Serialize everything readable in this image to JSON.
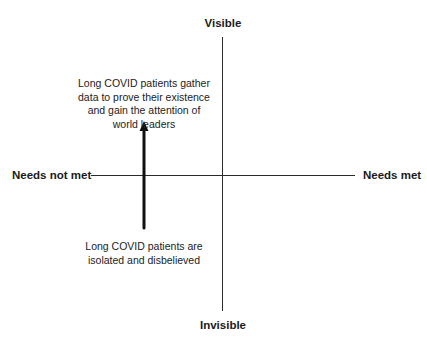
{
  "diagram": {
    "type": "quadrant",
    "axes": {
      "vertical": {
        "top_label": "Visible",
        "bottom_label": "Invisible"
      },
      "horizontal": {
        "left_label": "Needs not met",
        "right_label": "Needs met"
      }
    },
    "annotations": [
      {
        "id": "start",
        "text": "Long COVID patients are isolated and disbelieved",
        "position": "lower-left"
      },
      {
        "id": "end",
        "text": "Long COVID patients gather data to prove their existence and gain the attention of world leaders",
        "position": "upper-left"
      }
    ],
    "arrow": {
      "from": "start",
      "to": "end",
      "direction": "up"
    },
    "colors": {
      "line": "#2a2a2a",
      "arrow": "#111111",
      "text": "#1a1a1a",
      "background": "#ffffff"
    }
  },
  "labels": {
    "visible": "Visible",
    "invisible": "Invisible",
    "needs_not_met": "Needs not met",
    "needs_met": "Needs met"
  },
  "notes": {
    "top": "Long COVID patients gather data to prove their existence and gain the attention of world leaders",
    "bottom": "Long COVID patients are isolated and disbelieved"
  }
}
